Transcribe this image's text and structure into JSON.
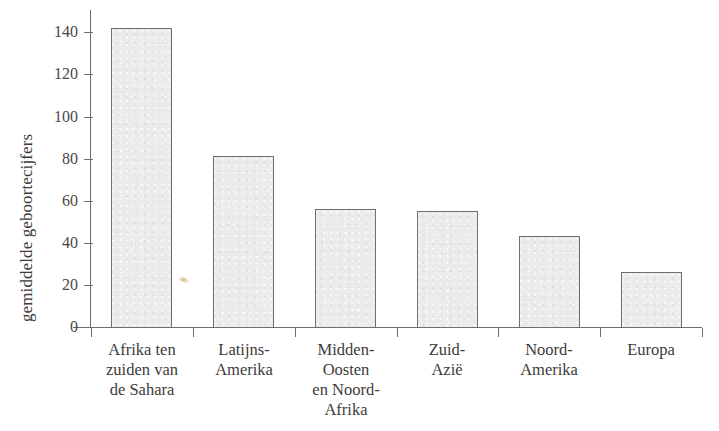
{
  "chart_data": {
    "type": "bar",
    "title": "",
    "xlabel": "",
    "ylabel": "gemiddelde geboortecijfers",
    "categories": [
      "Afrika ten\nzuiden van\nde Sahara",
      "Latijns-\nAmerika",
      "Midden-\nOosten\nen Noord-\nAfrika",
      "Zuid-\nAzië",
      "Noord-\nAmerika",
      "Europa"
    ],
    "values": [
      142,
      81,
      56,
      55,
      43,
      26
    ],
    "ylim": [
      0,
      150
    ],
    "yticks": [
      0,
      20,
      40,
      60,
      80,
      100,
      120,
      140
    ],
    "ytick_labels": [
      "0",
      "20",
      "40",
      "60",
      "80",
      "100",
      "120",
      "140"
    ],
    "grid": false,
    "legend": false,
    "bar_fill_color": "#ebebeb",
    "bar_edge_color": "#6f6f6f",
    "axis_color": "#6d6d6d",
    "text_color": "#3d3b3a"
  }
}
